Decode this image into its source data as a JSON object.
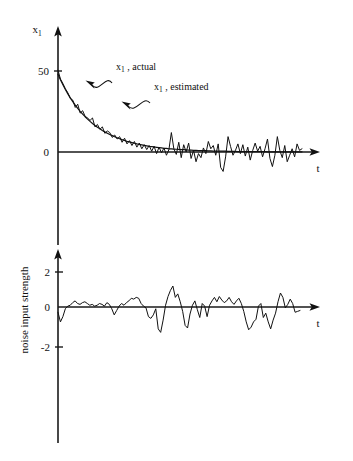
{
  "figure": {
    "background_color": "#ffffff",
    "ink_color": "#111111",
    "width": 353,
    "height": 461
  },
  "chart_data": [
    {
      "type": "line",
      "id": "state-estimate-plot",
      "title": "",
      "xlabel": "t",
      "ylabel": "x₁",
      "ylim": [
        -18,
        62
      ],
      "xlim": [
        0,
        100
      ],
      "yticks": [
        0,
        50
      ],
      "ytick_labels": [
        "0",
        "50"
      ],
      "grid": false,
      "legend_position": "inline-annotations",
      "annotations": [
        {
          "text": "x₁ , actual",
          "base": "x₁",
          "suffix": " , actual"
        },
        {
          "text": "x₁ , estimated",
          "base": "x₁",
          "suffix": " , estimated"
        }
      ],
      "series": [
        {
          "name": "x₁ , estimated",
          "style": "smooth",
          "values": [
            48.0,
            44.6,
            41.5,
            38.6,
            35.9,
            33.4,
            31.1,
            28.9,
            26.9,
            25.1,
            23.4,
            21.8,
            20.3,
            18.9,
            17.6,
            16.4,
            15.3,
            14.3,
            13.3,
            12.4,
            11.6,
            10.8,
            10.1,
            9.4,
            8.8,
            8.2,
            7.6,
            7.1,
            6.6,
            6.2,
            5.8,
            5.4,
            5.0,
            4.7,
            4.4,
            4.1,
            3.8,
            3.5,
            3.3,
            3.1,
            2.9,
            2.7,
            2.5,
            2.3,
            2.2,
            2.0,
            1.9,
            1.8,
            1.7,
            1.6,
            1.5,
            1.4,
            1.3,
            1.2,
            1.1,
            1.0,
            1.0,
            0.9,
            0.9,
            0.8,
            0.8,
            0.7,
            0.7,
            0.6,
            0.6,
            0.6,
            0.5,
            0.5,
            0.5,
            0.4,
            0.4,
            0.4,
            0.4,
            0.3,
            0.3,
            0.3,
            0.3,
            0.3,
            0.2,
            0.2,
            0.2,
            0.2,
            0.2,
            0.2,
            0.2,
            0.1,
            0.1,
            0.1,
            0.1,
            0.1,
            0.1,
            0.1,
            0.1,
            0.1,
            0.1,
            0.1,
            0.1,
            0.1,
            0.1,
            0.1
          ]
        },
        {
          "name": "x₁ , actual",
          "style": "noisy",
          "values": [
            50.5,
            45.0,
            42.2,
            39.0,
            36.5,
            33.0,
            32.0,
            27.5,
            29.5,
            24.0,
            25.5,
            22.0,
            21.0,
            19.5,
            21.0,
            15.5,
            17.0,
            14.0,
            15.5,
            11.5,
            13.0,
            12.0,
            9.0,
            10.5,
            8.0,
            9.5,
            6.0,
            8.5,
            5.0,
            7.0,
            4.0,
            6.5,
            3.0,
            5.5,
            2.0,
            4.5,
            1.5,
            4.0,
            0.5,
            3.5,
            -1.0,
            3.0,
            -0.5,
            2.5,
            -2.0,
            1.5,
            12.0,
            2.0,
            -1.5,
            6.0,
            -3.5,
            4.5,
            0.0,
            5.5,
            -4.0,
            1.0,
            -6.0,
            -1.0,
            -3.5,
            2.5,
            -1.0,
            6.5,
            2.0,
            4.0,
            -2.0,
            5.0,
            -9.5,
            -12.0,
            -3.0,
            9.5,
            3.5,
            -2.0,
            1.0,
            5.0,
            -1.0,
            4.5,
            -2.5,
            3.0,
            -5.0,
            1.0,
            5.5,
            0.5,
            3.5,
            -3.0,
            2.0,
            8.0,
            -4.0,
            -9.0,
            -2.0,
            9.5,
            1.0,
            -3.5,
            4.0,
            -6.0,
            -2.0,
            2.0,
            -3.0,
            5.0,
            1.0,
            2.0
          ]
        }
      ]
    },
    {
      "type": "line",
      "id": "noise-input-plot",
      "title": "",
      "xlabel": "t",
      "ylabel": "noise input strength",
      "ylim": [
        -3.3,
        3.0
      ],
      "xlim": [
        0,
        100
      ],
      "yticks": [
        -2,
        0,
        2
      ],
      "ytick_labels": [
        "-2",
        "0",
        "2"
      ],
      "grid": false,
      "series": [
        {
          "name": "noise input strength",
          "style": "noisy",
          "values": [
            -0.3,
            -0.85,
            -0.55,
            -0.1,
            0.05,
            0.1,
            0.25,
            0.35,
            0.2,
            0.15,
            0.25,
            0.3,
            0.2,
            0.1,
            0.15,
            0.05,
            0.1,
            0.2,
            0.15,
            0.05,
            0.25,
            0.15,
            -0.1,
            -0.45,
            -0.2,
            0.05,
            0.2,
            0.1,
            0.25,
            0.35,
            0.5,
            0.45,
            0.55,
            0.5,
            0.2,
            0.05,
            -0.05,
            -0.55,
            -0.65,
            -0.45,
            -0.1,
            -1.25,
            -1.45,
            -0.75,
            0.1,
            0.6,
            0.95,
            1.2,
            0.55,
            0.75,
            0.3,
            -0.25,
            -1.05,
            -1.2,
            -0.4,
            0.1,
            0.35,
            -0.15,
            -0.6,
            0.2,
            0.05,
            -0.55,
            0.1,
            0.35,
            0.55,
            0.3,
            0.6,
            0.4,
            0.25,
            0.35,
            0.55,
            0.3,
            0.15,
            0.35,
            0.5,
            0.2,
            -0.25,
            -0.85,
            -1.3,
            -1.15,
            -0.85,
            -0.7,
            0.05,
            0.2,
            -0.6,
            -0.35,
            -0.85,
            -1.25,
            -0.75,
            -0.35,
            0.3,
            0.8,
            0.55,
            -0.05,
            0.15,
            0.45,
            0.2,
            -0.3,
            -0.25,
            -0.2
          ]
        }
      ]
    }
  ]
}
